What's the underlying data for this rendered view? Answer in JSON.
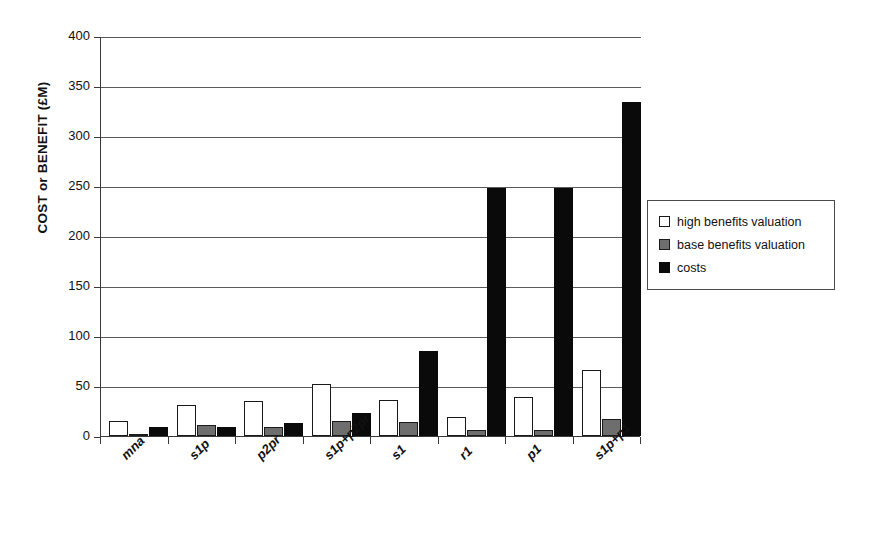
{
  "chart_data": {
    "type": "bar",
    "title": "",
    "xlabel": "",
    "ylabel": "COST or BENEFIT (£M)",
    "ylim": [
      0,
      400
    ],
    "ytick_step": 50,
    "yticks": [
      "400",
      "350",
      "300",
      "250",
      "200",
      "150",
      "100",
      "50",
      "0"
    ],
    "grid": true,
    "legend_position": "right",
    "categories": [
      "mna",
      "s1p",
      "p2pr",
      "s1p+p2pr",
      "s1",
      "r1",
      "p1",
      "s1p+p1"
    ],
    "series": [
      {
        "name": "high benefits valuation",
        "color": "#ffffff",
        "values": [
          15,
          31,
          35,
          52,
          36,
          19,
          39,
          66
        ]
      },
      {
        "name": "base benefits valuation",
        "color": "#6e6e6e",
        "values": [
          2,
          11,
          9,
          15,
          14,
          6,
          6,
          17
        ]
      },
      {
        "name": "costs",
        "color": "#0a0a0a",
        "values": [
          9,
          9,
          13,
          23,
          85,
          248,
          248,
          334
        ]
      }
    ]
  },
  "legend": {
    "items": [
      {
        "label": "high benefits valuation",
        "swatch": "high"
      },
      {
        "label": "base benefits valuation",
        "swatch": "base"
      },
      {
        "label": "costs",
        "swatch": "cost"
      }
    ]
  }
}
